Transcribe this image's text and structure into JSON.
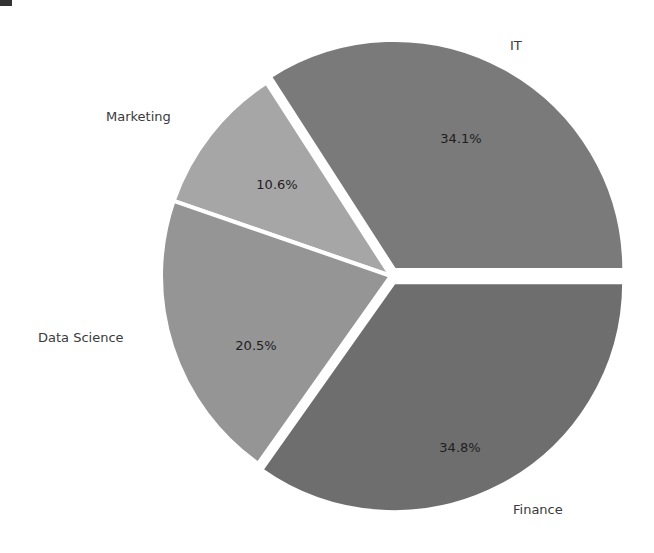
{
  "chart_data": {
    "type": "pie",
    "title": "",
    "categories": [
      "IT",
      "Marketing",
      "Data Science",
      "Finance"
    ],
    "values": [
      34.1,
      10.6,
      20.5,
      34.8
    ],
    "labels_pct": [
      "34.1%",
      "10.6%",
      "20.5%",
      "34.8%"
    ],
    "colors": [
      "#7a7a7a",
      "#a6a6a6",
      "#959595",
      "#6e6e6e"
    ],
    "explode": [
      0.03,
      0.0,
      0.0,
      0.03
    ],
    "startangle": 0,
    "counterclock": true,
    "legend": "none"
  },
  "labels": {
    "it": "IT",
    "marketing": "Marketing",
    "data_science": "Data Science",
    "finance": "Finance"
  },
  "pcts": {
    "it": "34.1%",
    "marketing": "10.6%",
    "data_science": "20.5%",
    "finance": "34.8%"
  }
}
